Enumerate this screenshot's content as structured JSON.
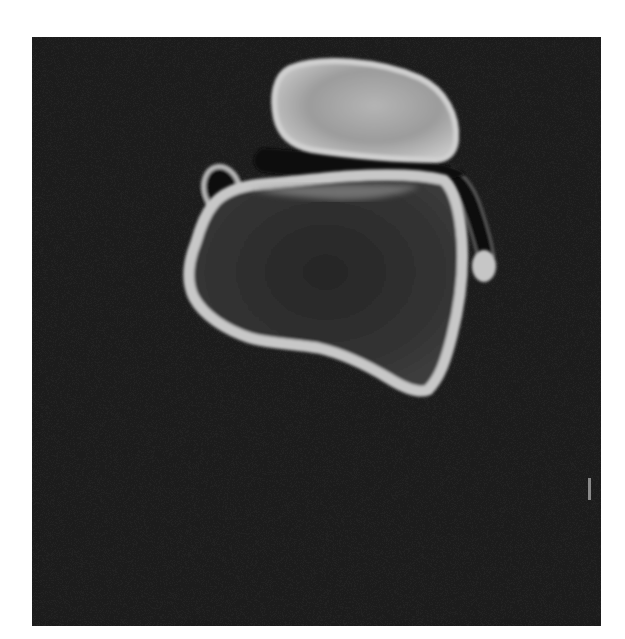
{
  "image": {
    "kind": "grayscale CT cross-section",
    "subject": "bone cross-section (ankle/hindfoot axial slice)",
    "caption": "",
    "orientation_marker": "scale/orientation tick mark (unlabeled)"
  },
  "colors": {
    "page_background": "#ffffff",
    "scan_background": "#1c1c1c",
    "cortical_bone": "#c8c8c8",
    "bone_rim_bright": "#d2d2d2",
    "upper_bone_interior": "#a6a6a6",
    "trabecular_interior": "#2e2e2e",
    "soft_tissue_dark": "#0e0e0e",
    "marker": "#8a8a8a"
  },
  "structures": [
    {
      "id": "upper-bone",
      "label": "upper bone section (oval)"
    },
    {
      "id": "joint-space",
      "label": "dark joint space band"
    },
    {
      "id": "lower-bone",
      "label": "large lower bone section with cortical rim"
    },
    {
      "id": "small-loop",
      "label": "small ring-shaped structure at upper-left"
    },
    {
      "id": "tendon-strip",
      "label": "dark tendon strip along right edge"
    },
    {
      "id": "right-knob",
      "label": "bright rounded knob at right"
    },
    {
      "id": "edge-marker",
      "label": "small vertical marker at right border"
    }
  ]
}
